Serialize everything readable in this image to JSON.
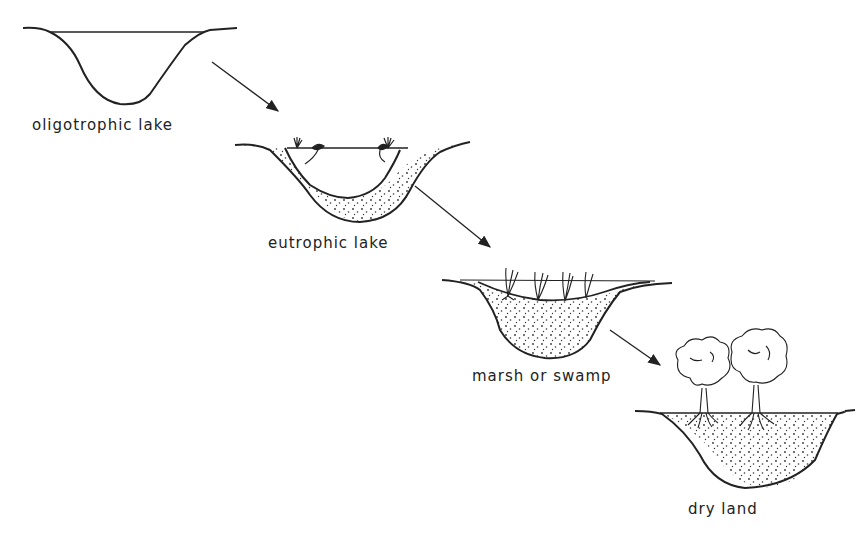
{
  "diagram": {
    "type": "lake succession stages",
    "stages": [
      {
        "id": "stage-1",
        "label": "oligotrophic lake"
      },
      {
        "id": "stage-2",
        "label": "eutrophic lake"
      },
      {
        "id": "stage-3",
        "label": "marsh or swamp"
      },
      {
        "id": "stage-4",
        "label": "dry land"
      }
    ],
    "arrows": [
      {
        "from": "oligotrophic lake",
        "to": "eutrophic lake"
      },
      {
        "from": "eutrophic lake",
        "to": "marsh or swamp"
      },
      {
        "from": "marsh or swamp",
        "to": "dry land"
      }
    ],
    "colors": {
      "line": "#222222",
      "background": "#ffffff",
      "sediment_dots": "#333333"
    }
  }
}
